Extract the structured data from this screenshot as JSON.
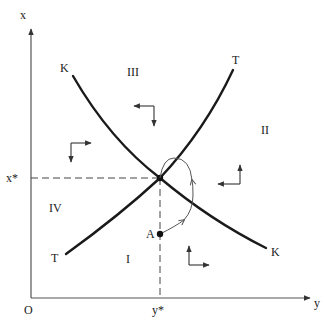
{
  "diagram": {
    "axes": {
      "vertical_label": "x",
      "horizontal_label": "y",
      "origin_label": "O"
    },
    "equilibrium": {
      "x_label": "x*",
      "y_label": "y*"
    },
    "curves": [
      {
        "name": "K",
        "label_top": "K",
        "label_bottom": "K",
        "shape": "downward-sloping"
      },
      {
        "name": "T",
        "label_top": "T",
        "label_bottom": "T",
        "shape": "upward-sloping"
      }
    ],
    "regions": [
      {
        "label": "I",
        "arrows": "up-right"
      },
      {
        "label": "II",
        "arrows": "up-left"
      },
      {
        "label": "III",
        "arrows": "down-left"
      },
      {
        "label": "IV",
        "arrows": "down-right"
      }
    ],
    "point_A": {
      "label": "A"
    },
    "colors": {
      "curve": "#1a1a1a",
      "axis": "#555555",
      "background": "#ffffff"
    }
  }
}
